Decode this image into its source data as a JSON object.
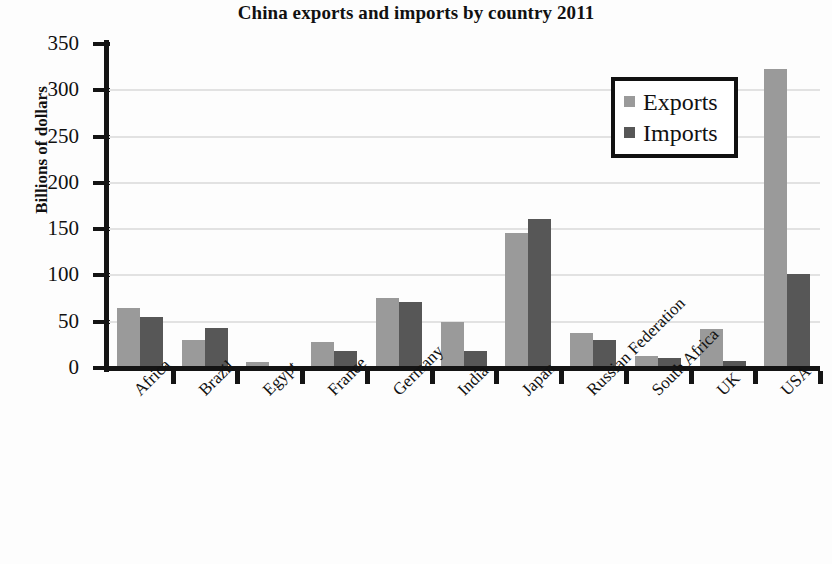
{
  "chart_data": {
    "type": "bar",
    "title": "China exports and imports by country 2011",
    "xlabel": "",
    "ylabel": "Billions of dollars",
    "ylim": [
      0,
      350
    ],
    "ytick_step": 50,
    "yticks": [
      0,
      50,
      100,
      150,
      200,
      250,
      300,
      350
    ],
    "grid": true,
    "legend_position": "top-right",
    "categories": [
      "Africa",
      "Brazil",
      "Egypt",
      "France",
      "Germany",
      "India",
      "Japan",
      "Russian Federation",
      "South Africa",
      "UK",
      "USA"
    ],
    "series": [
      {
        "name": "Exports",
        "color": "#9a9a9a",
        "values": [
          65,
          30,
          6,
          28,
          76,
          50,
          146,
          38,
          13,
          42,
          323
        ]
      },
      {
        "name": "Imports",
        "color": "#575757",
        "values": [
          55,
          43,
          1,
          18,
          71,
          18,
          161,
          30,
          11,
          8,
          102
        ]
      }
    ]
  },
  "legend": {
    "items": [
      {
        "label": "Exports",
        "swatch": "exports"
      },
      {
        "label": "Imports",
        "swatch": "imports"
      }
    ]
  },
  "colors": {
    "exports": "#9a9a9a",
    "imports": "#575757",
    "axis": "#141414",
    "gridline": "#e2e2e2",
    "background": "#fdfdfd"
  }
}
